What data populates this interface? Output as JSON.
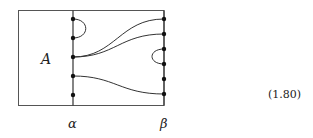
{
  "diagram": {
    "region_label": "A",
    "left_line_label": "α",
    "right_line_label": "β",
    "equation_number": "(1.80)",
    "stroke_color": "#333333",
    "left_dots_y": [
      19,
      38,
      57,
      76,
      95
    ],
    "right_dots_y": [
      19,
      34,
      49,
      64,
      79,
      94
    ],
    "curves": [
      {
        "type": "cap",
        "side": "left",
        "from": 19,
        "to": 38
      },
      {
        "type": "strand",
        "from_left": 57,
        "to_right": 19
      },
      {
        "type": "strand",
        "from_left": 57,
        "to_right": 34
      },
      {
        "type": "cup",
        "side": "right",
        "from": 49,
        "to": 64
      },
      {
        "type": "strand",
        "from_left": 76,
        "to_right": 94
      }
    ]
  }
}
